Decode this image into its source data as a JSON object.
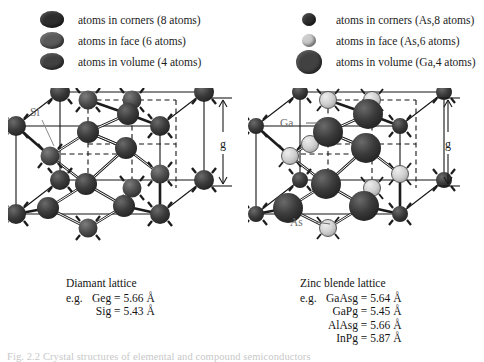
{
  "figure": {
    "caption_partial": "Fig. 2.2 Crystal structures of elemental and compound semiconductors"
  },
  "left_panel": {
    "legend": {
      "items": [
        {
          "icon": "atom-circle-dark",
          "label": "atoms in corners (8 atoms)",
          "color": "#2e2e2e",
          "size": "medium"
        },
        {
          "icon": "atom-circle-mid",
          "label": "atoms in face (6 atoms)",
          "color": "#5a5a5a",
          "size": "medium"
        },
        {
          "icon": "atom-circle-volume",
          "label": "atoms in volume (4 atoms)",
          "color": "#414141",
          "size": "medium"
        }
      ]
    },
    "diagram": {
      "name": "diamond-lattice-diagram",
      "atom_label": "Si",
      "dimension_label": "g"
    },
    "caption": {
      "title": "Diamant lattice",
      "eg_label": "e.g.",
      "rows": [
        {
          "material": "Ge",
          "value": "g = 5.66 Å"
        },
        {
          "material": "Si",
          "value": "g = 5.43 Å"
        }
      ]
    }
  },
  "right_panel": {
    "legend": {
      "items": [
        {
          "icon": "atom-circle-dark-small",
          "label": "atoms in corners (As,8 atoms)",
          "color": "#2b2b2b",
          "size": "small"
        },
        {
          "icon": "atom-circle-light-small",
          "label": "atoms in face (As,6 atoms)",
          "color": "#c9c9c9",
          "size": "small"
        },
        {
          "icon": "atom-circle-dark-large",
          "label": "atoms in volume (Ga,4 atoms)",
          "color": "#3a3a3a",
          "size": "large"
        }
      ]
    },
    "diagram": {
      "name": "zinc-blende-lattice-diagram",
      "atom_label_ga": "Ga",
      "atom_label_as": "As",
      "dimension_label": "g"
    },
    "caption": {
      "title": "Zinc blende lattice",
      "eg_label": "e.g.",
      "rows": [
        {
          "material": "GaAs",
          "value": "g = 5.64 Å"
        },
        {
          "material": "GaP",
          "value": "g = 5.45 Å"
        },
        {
          "material": "AlAs",
          "value": "g = 5.66 Å"
        },
        {
          "material": "InP",
          "value": "g = 5.87 Å"
        }
      ]
    }
  },
  "colors": {
    "atom_dark": "#2e2e2e",
    "atom_mid": "#5a5a5a",
    "atom_light": "#c9c9c9",
    "atom_volume": "#414141",
    "line": "#151515",
    "label_gray": "#6e6e6e",
    "background": "#ffffff"
  }
}
